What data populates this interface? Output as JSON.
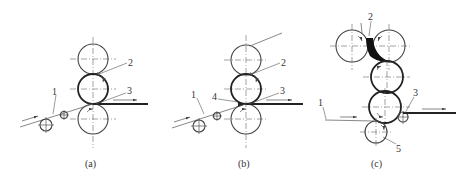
{
  "figure": {
    "panels": [
      {
        "id": "a",
        "caption": "(a)",
        "labels": {
          "l1": "1",
          "l2": "2",
          "l3": "3"
        },
        "components": {
          "1": "incoming web/foil",
          "2": "coating material between rolls",
          "3": "nip / exit strip"
        }
      },
      {
        "id": "b",
        "caption": "(b)",
        "labels": {
          "l1": "1",
          "l2": "2",
          "l3": "3",
          "l4": "4"
        }
      },
      {
        "id": "c",
        "caption": "(c)",
        "labels": {
          "l1": "1",
          "l2": "2",
          "l3": "3",
          "l5": "5"
        }
      }
    ],
    "colors": {
      "line": "#444444",
      "background": "#ffffff"
    }
  }
}
